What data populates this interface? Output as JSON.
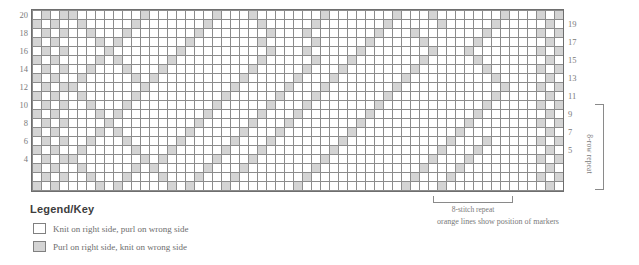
{
  "chart_data": {
    "type": "heatmap",
    "xlabel": "stitches",
    "ylabel": "rows",
    "columns": 59,
    "rows": 20,
    "row_labels_left": [
      20,
      18,
      16,
      14,
      12,
      10,
      8,
      6,
      4
    ],
    "row_labels_right": [
      19,
      17,
      15,
      13,
      11,
      9,
      7,
      5
    ],
    "legend_entries": [
      {
        "key": "knit",
        "color": "#ffffff",
        "label": "Knit on right side, purl on wrong side"
      },
      {
        "key": "purl",
        "color": "#d4d4d4",
        "label": "Purl on right side, knit on wrong side"
      }
    ],
    "marker_columns": [
      3,
      56
    ],
    "stitch_repeat": 8,
    "row_repeat": 8,
    "cells": [
      "01011000000010000000100010000000100000001000100000001000101",
      "10100100000100000001000001000001000000010000010000010000010",
      "01010010001000000010000000100010000000100010000000100000101",
      "10100001010000000100000001000001000001000001000001000000010",
      "01010000100000001000000000100010000010000000100010000000101",
      "10100001010000010000000001000001000100000001000001000000010",
      "01010010001000100000000010000010001000000010000000100000101",
      "10100100000101000000000100000100010000000100000000010000010",
      "01011000000010000000001000001000100000001000000000001000101",
      "10100100000100000000010000010001000000010000000000010000010",
      "01010010001000000000100000100010000000100000000000100000101",
      "10100001010000000001000001000100000001000000000001000000010",
      "01010000100000000010000010001000000010000000000010000000101",
      "10100001010000000100000100010000000100000000000100000000010",
      "01010010001000001000001000100000001000000000001000100000101",
      "10100100000100010000010001000000010000000000010001000000010",
      "01011000000010100000100010000000100000000000100010000000101",
      "10100100000101000001000100000001000000000001000100000000010",
      "01010010001000100010001000000010000000000010001000000000101",
      "10100001010000010100010000000100000000000100010000000000010"
    ]
  },
  "legend": {
    "title": "Legend/Key"
  },
  "annotations": {
    "stitch_repeat_label": "8-stitch repeat",
    "markers_note": "orange lines show position of markers",
    "row_repeat_label": "8-row repeat"
  }
}
